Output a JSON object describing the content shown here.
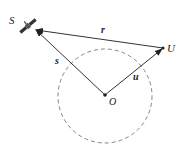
{
  "labels": {
    "satellite": "S",
    "user": "U",
    "origin": "O",
    "vec_r": "r",
    "vec_s": "s",
    "vec_u": "u"
  },
  "colors": {
    "stroke": "#333333",
    "circle": "#777777"
  }
}
